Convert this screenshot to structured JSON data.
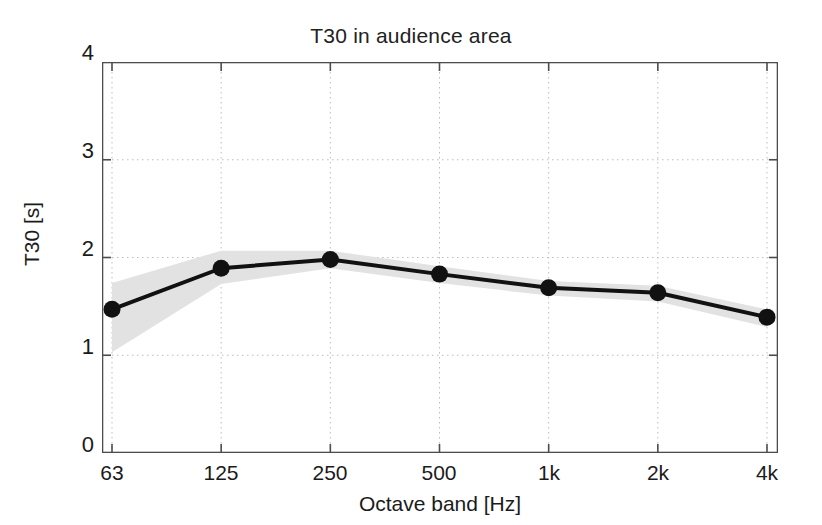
{
  "chart_data": {
    "type": "line",
    "title": "T30 in audience area",
    "xlabel": "Octave band [Hz]",
    "ylabel": "T30 [s]",
    "categories": [
      "63",
      "125",
      "250",
      "500",
      "1k",
      "2k",
      "4k"
    ],
    "x_tick_labels": [
      "63",
      "125",
      "250",
      "500",
      "1k",
      "2k",
      "4k"
    ],
    "y_tick_labels": [
      "0",
      "1",
      "2",
      "3",
      "4"
    ],
    "y_ticks": [
      0,
      1,
      2,
      3,
      4
    ],
    "ylim": [
      0,
      4
    ],
    "xlim": [
      0,
      6
    ],
    "grid": "dotted-both-axes",
    "legend": "none",
    "series": [
      {
        "name": "T30 mean",
        "marker": "filled-circle",
        "color": "#111111",
        "values": [
          1.47,
          1.89,
          1.98,
          1.83,
          1.69,
          1.64,
          1.39
        ]
      },
      {
        "name": "T30 spread band",
        "type": "area",
        "color": "#e2e2e2",
        "upper": [
          1.74,
          2.07,
          2.07,
          1.91,
          1.76,
          1.71,
          1.47
        ],
        "lower": [
          1.03,
          1.73,
          1.89,
          1.74,
          1.61,
          1.55,
          1.29
        ]
      }
    ]
  },
  "figure": {
    "background_color": "#ffffff",
    "axis_color": "#4d4d4d",
    "grid_color": "#bdbdbd",
    "line_color": "#111111",
    "band_color": "#e4e4e4"
  }
}
